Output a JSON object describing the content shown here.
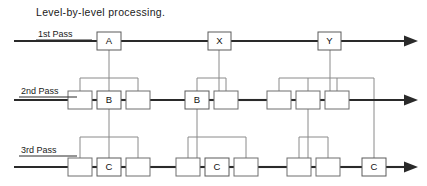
{
  "title": "Level-by-level processing.",
  "diagram": {
    "type": "level-by-level-processing-diagram",
    "width": 427,
    "height": 186,
    "passes": [
      {
        "id": "pass-1",
        "label": "1st Pass",
        "label_x": 38,
        "label_y": 37,
        "label_rule": {
          "x1": 36,
          "y1": 40,
          "x2": 92,
          "y2": 40
        },
        "baseline_y": 41,
        "line_start_x": 14,
        "line_end_x": 404,
        "arrow_x": 418,
        "boxes": [
          {
            "id": "p1-a",
            "letter": "A",
            "x": 97,
            "y": 32,
            "w": 24,
            "h": 18
          },
          {
            "id": "p1-x",
            "letter": "X",
            "x": 208,
            "y": 32,
            "w": 23,
            "h": 18
          },
          {
            "id": "p1-y",
            "letter": "Y",
            "x": 318,
            "y": 32,
            "w": 23,
            "h": 18
          }
        ]
      },
      {
        "id": "pass-2",
        "label": "2nd Pass",
        "label_x": 21,
        "label_y": 94,
        "label_rule": {
          "x1": 19,
          "y1": 97,
          "x2": 77,
          "y2": 97
        },
        "baseline_y": 100,
        "line_start_x": 14,
        "line_end_x": 404,
        "arrow_x": 418,
        "boxes": [
          {
            "id": "p2-1",
            "letter": "",
            "x": 68,
            "y": 91,
            "w": 24,
            "h": 18
          },
          {
            "id": "p2-b1",
            "letter": "B",
            "x": 97,
            "y": 91,
            "w": 24,
            "h": 18
          },
          {
            "id": "p2-3",
            "letter": "",
            "x": 126,
            "y": 91,
            "w": 24,
            "h": 18
          },
          {
            "id": "p2-b2",
            "letter": "B",
            "x": 185,
            "y": 91,
            "w": 24,
            "h": 18
          },
          {
            "id": "p2-5",
            "letter": "",
            "x": 214,
            "y": 91,
            "w": 24,
            "h": 18
          },
          {
            "id": "p2-6",
            "letter": "",
            "x": 267,
            "y": 91,
            "w": 24,
            "h": 18
          },
          {
            "id": "p2-7",
            "letter": "",
            "x": 296,
            "y": 91,
            "w": 24,
            "h": 18
          },
          {
            "id": "p2-8",
            "letter": "",
            "x": 325,
            "y": 91,
            "w": 24,
            "h": 18
          }
        ]
      },
      {
        "id": "pass-3",
        "label": "3rd Pass",
        "label_x": 21,
        "label_y": 153,
        "label_rule": {
          "x1": 19,
          "y1": 156,
          "x2": 77,
          "y2": 156
        },
        "baseline_y": 167,
        "line_start_x": 14,
        "line_end_x": 404,
        "arrow_x": 418,
        "boxes": [
          {
            "id": "p3-1",
            "letter": "",
            "x": 68,
            "y": 158,
            "w": 24,
            "h": 18
          },
          {
            "id": "p3-c1",
            "letter": "C",
            "x": 97,
            "y": 158,
            "w": 24,
            "h": 18
          },
          {
            "id": "p3-3",
            "letter": "",
            "x": 126,
            "y": 158,
            "w": 24,
            "h": 18
          },
          {
            "id": "p3-4",
            "letter": "",
            "x": 176,
            "y": 158,
            "w": 24,
            "h": 18
          },
          {
            "id": "p3-c2",
            "letter": "C",
            "x": 205,
            "y": 158,
            "w": 24,
            "h": 18
          },
          {
            "id": "p3-6",
            "letter": "",
            "x": 234,
            "y": 158,
            "w": 24,
            "h": 18
          },
          {
            "id": "p3-7",
            "letter": "",
            "x": 287,
            "y": 158,
            "w": 24,
            "h": 18
          },
          {
            "id": "p3-8",
            "letter": "",
            "x": 316,
            "y": 158,
            "w": 24,
            "h": 18
          },
          {
            "id": "p3-c3",
            "letter": "C",
            "x": 362,
            "y": 158,
            "w": 24,
            "h": 18
          }
        ]
      }
    ],
    "connectors": [
      {
        "id": "conn-a-down",
        "d": "M 109 50 L 109 109"
      },
      {
        "id": "conn-a-bracket",
        "d": "M 80 109 L 80 78 L 138 78 L 138 109"
      },
      {
        "id": "conn-x-down",
        "d": "M 219 50 L 219 91"
      },
      {
        "id": "conn-x-bracket",
        "d": "M 197 91 L 197 78 L 226 78 L 226 91"
      },
      {
        "id": "conn-y-down",
        "d": "M 330 50 L 330 91"
      },
      {
        "id": "conn-y-bracket-left",
        "d": "M 279 91 L 279 78 L 374 78 L 374 158"
      },
      {
        "id": "conn-y-bracket-mid",
        "d": "M 308 91 L 308 78"
      },
      {
        "id": "conn-y-bracket-right",
        "d": "M 337 91 L 337 78"
      },
      {
        "id": "conn-b1-down",
        "d": "M 109 109 L 109 158"
      },
      {
        "id": "conn-b1-bracket",
        "d": "M 80 158 L 80 137 L 138 137 L 138 158"
      },
      {
        "id": "conn-b2-down",
        "d": "M 197 109 L 197 158"
      },
      {
        "id": "conn-b2-bracket",
        "d": "M 188 158 L 188 137 L 246 137 L 246 158"
      },
      {
        "id": "conn-p27-down",
        "d": "M 308 109 L 308 158"
      },
      {
        "id": "conn-p27-bracket",
        "d": "M 299 158 L 299 137 L 328 137 L 328 158"
      }
    ],
    "colors": {
      "ink": "#2a2a2a",
      "connector": "#8a8a8a",
      "box_stroke": "#6e6e6e",
      "background": "#ffffff"
    }
  }
}
